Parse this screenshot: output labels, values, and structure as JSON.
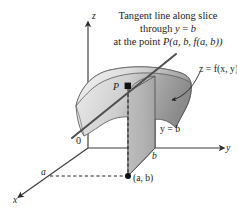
{
  "figure": {
    "caption": {
      "line1": "Tangent line along slice",
      "line2_prefix": "through ",
      "line2_var": "y",
      "line2_mid": " = ",
      "line2_val": "b",
      "line3_prefix": "at the point ",
      "line3_body": "P(a, b, f(a, b))",
      "full_text": "Tangent line along slice through y = b at the point P(a, b, f(a, b))"
    },
    "axes": {
      "z_label": "z",
      "y_label": "y",
      "x_label": "x",
      "origin_label": "0"
    },
    "ticks": {
      "b_label": "b",
      "a_label": "a"
    },
    "annotations": {
      "surface_label": "z = f(x, y)",
      "plane_label": "y = b",
      "point_p_label": "P",
      "point_ab_label": "(a, b)"
    },
    "colors": {
      "background": "#ffffff",
      "ink": "#1b1b1b",
      "axis_line": "#3a3a3a",
      "surface_light": "#e2e2e2",
      "surface_mid": "#c9c9c9",
      "surface_dark": "#8d8d8d",
      "surface_edge": "#5a5a5a",
      "plane_fill": "#b5b5b5",
      "plane_edge": "#4a4a4a",
      "dashed_line": "#2b2b2b",
      "tangent_line": "#4a4a4a",
      "marker": "#111111"
    },
    "geometry": {
      "origin": [
        88,
        148
      ],
      "z_axis_top": [
        88,
        20
      ],
      "y_axis_end": [
        228,
        148
      ],
      "x_axis_end": [
        14,
        200
      ],
      "b_tick": [
        155,
        148
      ],
      "a_tick": [
        48,
        172
      ],
      "point_ab": [
        128,
        176
      ],
      "point_p": [
        128,
        86
      ],
      "tangent_start": [
        74,
        136
      ],
      "tangent_end": [
        174,
        55
      ]
    }
  }
}
